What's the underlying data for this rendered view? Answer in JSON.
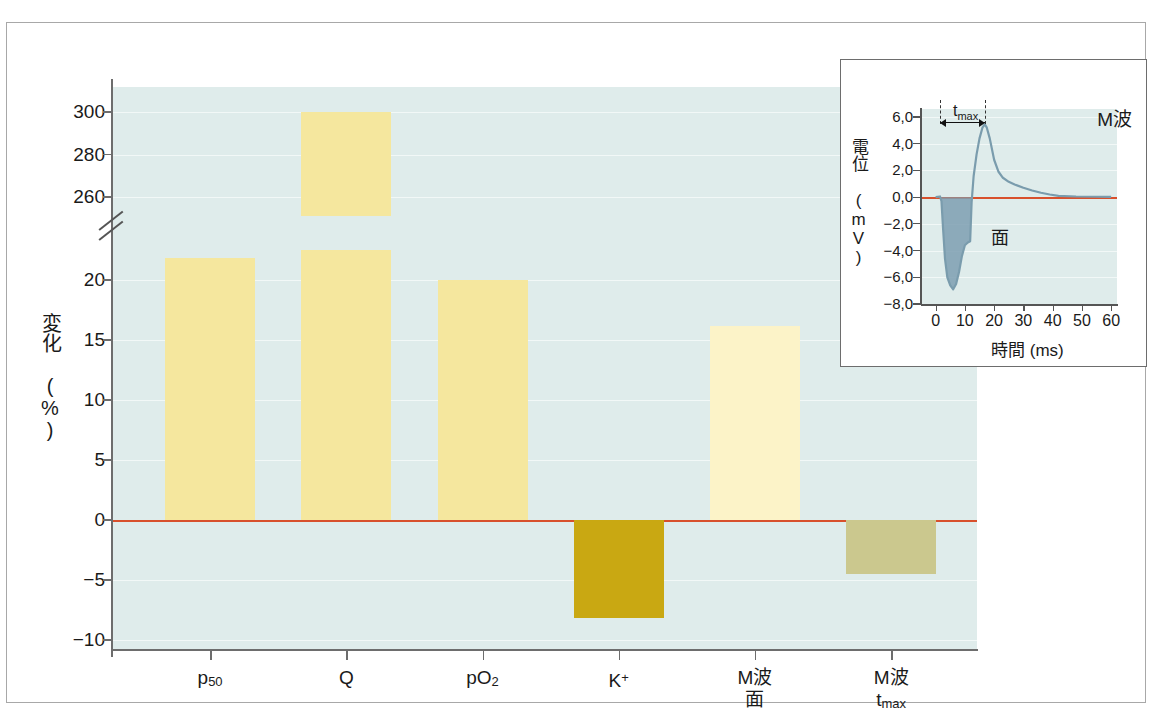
{
  "chart_data": {
    "type": "bar",
    "title": "",
    "xlabel": "",
    "ylabel": "変化 (%)",
    "ylabel_line1": "変化",
    "ylabel_line2": "(%)",
    "categories": [
      "p50",
      "Q",
      "pO2",
      "K+",
      "M波 面",
      "M波 tmax"
    ],
    "category_labels": [
      {
        "main": "p",
        "sub": "50",
        "sup": "",
        "line2": ""
      },
      {
        "main": "Q",
        "sub": "",
        "sup": "",
        "line2": ""
      },
      {
        "main": "pO",
        "sub": "2",
        "sup": "",
        "line2": ""
      },
      {
        "main": "K",
        "sub": "",
        "sup": "+",
        "line2": ""
      },
      {
        "main": "M波",
        "sub": "",
        "sup": "",
        "line2": "面"
      },
      {
        "main": "M波",
        "sub": "max",
        "sup": "",
        "line2": "t"
      }
    ],
    "values": [
      21.8,
      300,
      20.0,
      -8.2,
      16.2,
      -4.5
    ],
    "bar_colors": [
      "#f5e79e",
      "#f5e79e",
      "#f5e79e",
      "#c9a812",
      "#fcf3c8",
      "#cbc88e"
    ],
    "ytick_labels": [
      "300",
      "280",
      "260",
      "20",
      "15",
      "10",
      "5",
      "0",
      "-5",
      "-10"
    ],
    "ytick_values": [
      300,
      280,
      260,
      20,
      15,
      10,
      5,
      0,
      -5,
      -10
    ],
    "axis_break": true,
    "axis_break_between": [
      260,
      20
    ],
    "ylim_lower": [
      -10,
      20
    ],
    "ylim_upper": [
      255,
      305
    ],
    "grid": true,
    "legend": "none",
    "zero_line_color": "#d8502c",
    "plot_background": "#dfeceb"
  },
  "inset": {
    "title": "M波",
    "ylabel_v": "電位 (mV)",
    "ylabel_main": "電位",
    "ylabel_unit": "(mV)",
    "xlabel": "時間 (ms)",
    "ytick_labels": [
      "6,0",
      "4,0",
      "2,0",
      "0,0",
      "-2,0",
      "-4,0",
      "-6,0",
      "-8,0"
    ],
    "ytick_values": [
      6.0,
      4.0,
      2.0,
      0.0,
      -2.0,
      -4.0,
      -6.0,
      -8.0
    ],
    "xtick_labels": [
      "0",
      "10",
      "20",
      "30",
      "40",
      "50",
      "60"
    ],
    "xtick_values": [
      0,
      10,
      20,
      30,
      40,
      50,
      60
    ],
    "annotation_tmax": "t",
    "annotation_tmax_sub": "max",
    "annotation_area": "面",
    "trace_color": "#7a9cad",
    "fill_color": "#7e9fb2",
    "zero_line_color": "#d8502c",
    "plot_background": "#dfeceb",
    "chart_data": {
      "type": "line",
      "title": "M波",
      "xlabel": "時間 (ms)",
      "ylabel": "電位 (mV)",
      "xlim": [
        -5,
        62
      ],
      "ylim": [
        -8.0,
        6.6
      ],
      "series": [
        {
          "name": "M波",
          "x": [
            0,
            1.5,
            2.0,
            2.5,
            3.2,
            4.0,
            5.0,
            6.0,
            7.0,
            8.0,
            9.0,
            10.0,
            11.0,
            11.8,
            12.3,
            13.0,
            14.0,
            15.0,
            16.0,
            16.8,
            17.5,
            18.5,
            20.0,
            21.5,
            23.0,
            25.0,
            27.0,
            30.0,
            33.0,
            36.0,
            39.0,
            42.0,
            48.0,
            55.0,
            60.0
          ],
          "y": [
            0.0,
            0.05,
            -0.3,
            -2.2,
            -4.6,
            -6.0,
            -6.6,
            -6.9,
            -6.5,
            -5.6,
            -4.4,
            -3.6,
            -3.4,
            -3.3,
            -0.4,
            1.6,
            3.2,
            4.4,
            5.2,
            5.45,
            5.2,
            4.4,
            2.8,
            1.9,
            1.45,
            1.15,
            0.95,
            0.7,
            0.5,
            0.33,
            0.2,
            0.1,
            0.05,
            0.03,
            0.02
          ]
        }
      ],
      "annotations": [
        {
          "text": "tmax",
          "x_from": 1.5,
          "x_to": 16.8
        },
        {
          "text": "面",
          "x": 20,
          "y": -3.0
        }
      ]
    }
  }
}
